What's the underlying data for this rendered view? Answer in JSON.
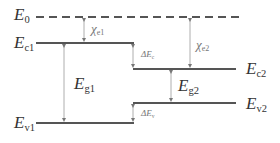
{
  "diagram": {
    "type": "band-alignment",
    "colors": {
      "line": "#555555",
      "arrow": "#999999",
      "text": "#333333"
    },
    "levels": {
      "E0": {
        "symbol": "E",
        "sub": "0",
        "style": "dashed"
      },
      "Ec1": {
        "symbol": "E",
        "sub": "c1"
      },
      "Ec2": {
        "symbol": "E",
        "sub": "c2"
      },
      "Ev1": {
        "symbol": "E",
        "sub": "v1"
      },
      "Ev2": {
        "symbol": "E",
        "sub": "v2"
      }
    },
    "quantities": {
      "chi_e1": {
        "symbol": "χ",
        "sub": "e1"
      },
      "chi_e2": {
        "symbol": "χ",
        "sub": "e2"
      },
      "Eg1": {
        "symbol": "E",
        "sub": "g1"
      },
      "Eg2": {
        "symbol": "E",
        "sub": "g2"
      },
      "dEc": {
        "symbol": "ΔE",
        "sub": "c"
      },
      "dEv": {
        "symbol": "ΔE",
        "sub": "v"
      }
    }
  }
}
